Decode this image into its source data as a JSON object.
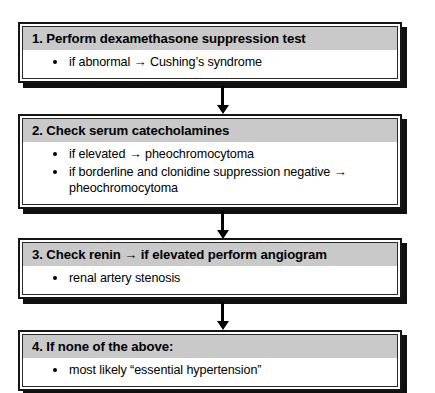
{
  "diagram": {
    "colors": {
      "header_band": "#c9c9c9",
      "body": "#ffffff",
      "border": "#151515",
      "shadow": "#101010",
      "text": "#000000"
    },
    "arrow_glyph": "→",
    "steps": [
      {
        "header": "1. Perform dexamethasone suppression test",
        "bullets": [
          "if abnormal → Cushing’s syndrome"
        ]
      },
      {
        "header": "2. Check serum catecholamines",
        "bullets": [
          "if elevated → pheochromocytoma",
          "if borderline and clonidine suppression negative → pheochromocytoma"
        ]
      },
      {
        "header": "3. Check renin → if elevated perform angiogram",
        "bullets": [
          "renal artery stenosis"
        ]
      },
      {
        "header": "4. If none of the above:",
        "bullets": [
          "most likely “essential hypertension”"
        ]
      }
    ],
    "connectors": [
      {
        "from": "step-1",
        "to": "step-2"
      },
      {
        "from": "step-2",
        "to": "step-3"
      },
      {
        "from": "step-3",
        "to": "step-4"
      }
    ]
  }
}
